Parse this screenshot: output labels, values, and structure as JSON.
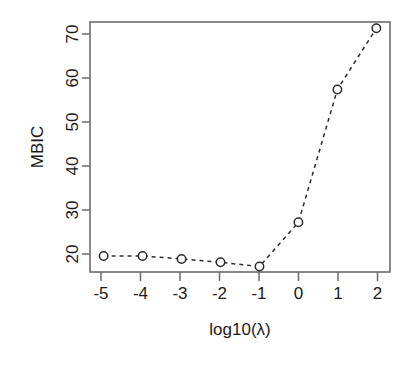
{
  "chart_data": {
    "type": "line",
    "title": "",
    "subtitle": "",
    "xlabel": "log10(λ)",
    "ylabel": "MBIC",
    "x": [
      -5,
      -4,
      -3,
      -2,
      -1,
      0,
      1,
      2
    ],
    "values": [
      18,
      18,
      17.3,
      16.5,
      15.5,
      26,
      57.5,
      72
    ],
    "series": [
      {
        "name": "MBIC",
        "values": [
          18,
          18,
          17.3,
          16.5,
          15.5,
          26,
          57.5,
          72
        ]
      }
    ],
    "xtick_labels": [
      "-5",
      "-4",
      "-3",
      "-2",
      "-1",
      "0",
      "1",
      "2"
    ],
    "xticks": [
      -5,
      -4,
      -3,
      -2,
      -1,
      0,
      1,
      2
    ],
    "ytick_labels": [
      "20",
      "30",
      "40",
      "50",
      "60",
      "70"
    ],
    "yticks": [
      20,
      30,
      40,
      50,
      60,
      70
    ],
    "xlim": [
      -5.35,
      2.35
    ],
    "ylim": [
      14.2,
      73.5
    ],
    "grid": false,
    "legend": "none",
    "line_style": "dashed",
    "marker": "open-circle",
    "colors": {
      "line": "#2b2b2b",
      "marker_fill": "#ffffff",
      "marker_stroke": "#2b2b2b",
      "axis": "#6b6b6b",
      "text": "#1a1a1a",
      "background": "#ffffff"
    }
  }
}
